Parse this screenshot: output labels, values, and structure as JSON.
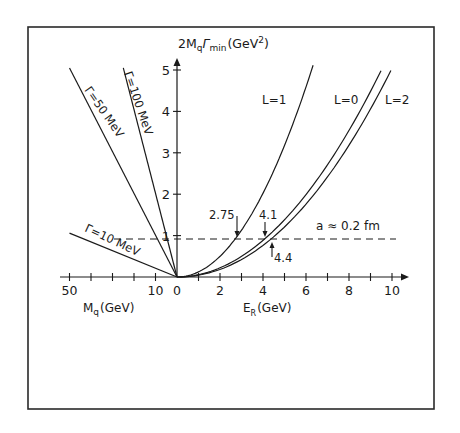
{
  "chart_data": {
    "type": "line",
    "title": "",
    "ylabel": "2MqΓmin (GeV²)",
    "ylabel_parts": {
      "base": "2M",
      "sub_q": "q",
      "gamma": "Γ",
      "sub_min": "min",
      "unit": "(GeV",
      "sup": "2",
      "close": ")"
    },
    "xlabel_right": "ER (GeV)",
    "xlabel_right_parts": {
      "base": "E",
      "sub": "R",
      "unit": "(GeV)"
    },
    "xlabel_left": "Mq (GeV)",
    "xlabel_left_parts": {
      "base": "M",
      "sub": "q",
      "unit": "(GeV)"
    },
    "ylim": [
      0,
      5
    ],
    "xlim_right": [
      0,
      10
    ],
    "xlim_left": [
      0,
      50
    ],
    "y_ticks": [
      1,
      2,
      3,
      4,
      5
    ],
    "y_tick_labels": [
      "1",
      "2",
      "3",
      "4",
      "5"
    ],
    "x_right_ticks": [
      1,
      2,
      3,
      4,
      5,
      6,
      7,
      8,
      9,
      10
    ],
    "x_right_tick_labels": [
      {
        "value": 0,
        "label": "0"
      },
      {
        "value": 2,
        "label": "2"
      },
      {
        "value": 4,
        "label": "4"
      },
      {
        "value": 6,
        "label": "6"
      },
      {
        "value": 8,
        "label": "8"
      },
      {
        "value": 10,
        "label": "10"
      }
    ],
    "x_left_tick_labels": [
      {
        "pos": -5,
        "label": "50"
      },
      {
        "pos": -1,
        "label": "10"
      }
    ],
    "grid": false,
    "series": [
      {
        "name": "L=1",
        "label": "L=1",
        "x": [
          0,
          1,
          2,
          2.75,
          3,
          4,
          5,
          6,
          6.33
        ],
        "y": [
          0,
          0.12,
          0.49,
          0.93,
          1.11,
          1.98,
          3.09,
          4.45,
          5.0
        ]
      },
      {
        "name": "L=0",
        "label": "L=0",
        "x": [
          0,
          1,
          2,
          3,
          4.1,
          5,
          6,
          7,
          8,
          9,
          9.49
        ],
        "y": [
          0,
          0.06,
          0.22,
          0.5,
          0.93,
          1.38,
          1.99,
          2.71,
          3.54,
          4.48,
          5.0
        ]
      },
      {
        "name": "L=2",
        "label": "L=2",
        "x": [
          0,
          1,
          2,
          3,
          4.4,
          5,
          6,
          7,
          8,
          9,
          9.95
        ],
        "y": [
          0,
          0.04,
          0.18,
          0.42,
          0.93,
          1.21,
          1.77,
          2.44,
          3.21,
          4.08,
          5.0
        ]
      },
      {
        "name": "Γ=100 MeV",
        "label": "Γ=100 MeV",
        "side": "left",
        "x": [
          0,
          -2.5
        ],
        "y": [
          0,
          5.05
        ]
      },
      {
        "name": "Γ=50 MeV",
        "label": "Γ=50 MeV",
        "side": "left",
        "x": [
          0,
          -5.0
        ],
        "y": [
          0,
          5.05
        ]
      },
      {
        "name": "Γ=10 MeV",
        "label": "Γ=10 MeV",
        "side": "left",
        "x": [
          0,
          -5.0
        ],
        "y": [
          0,
          1.06
        ]
      }
    ],
    "reference_line": {
      "label": "a ≈ 0.2 fm",
      "y": 0.93,
      "style": "dashed"
    },
    "annotations": [
      {
        "text": "2.75",
        "x": 2.75,
        "y": 0.93,
        "arrow": "down"
      },
      {
        "text": "4.1",
        "x": 4.1,
        "y": 0.93,
        "arrow": "down"
      },
      {
        "text": "4.4",
        "x": 4.4,
        "y": 0.93,
        "arrow": "up"
      }
    ]
  }
}
